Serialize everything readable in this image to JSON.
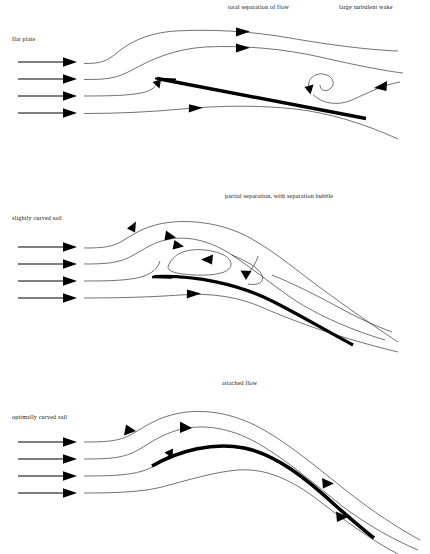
{
  "figure": {
    "background_color": "#ffffff",
    "ink_color": "#000000",
    "panel_count": 3
  },
  "panels": [
    {
      "id": "flat-plate",
      "index": 1,
      "side_label": "flat plate",
      "title_label": "total separation of flow",
      "title_label_2": "large turbulent wake",
      "inflow_arrow_count": 4,
      "streamline_count": 4,
      "features": [
        "separated shear layer",
        "recirculating vortex",
        "reversed flow arrow"
      ],
      "sail_shape": "straight",
      "sail_stroke_width": 3.4
    },
    {
      "id": "slightly-curved-sail",
      "index": 2,
      "side_label": "slightly curved sail",
      "title_label": "partial separation, with separation bubble",
      "inflow_arrow_count": 4,
      "streamline_count": 4,
      "features": [
        "separation bubble",
        "reattachment",
        "closed recirculation loop"
      ],
      "sail_shape": "slightly curved",
      "sail_stroke_width": 3.2
    },
    {
      "id": "optimally-curved-sail",
      "index": 3,
      "side_label": "optimally curved sail",
      "title_label": "attached flow",
      "inflow_arrow_count": 4,
      "streamline_count": 4,
      "features": [
        "fully attached flow",
        "smooth streamlines"
      ],
      "sail_shape": "optimally curved",
      "sail_stroke_width": 3.6
    }
  ]
}
